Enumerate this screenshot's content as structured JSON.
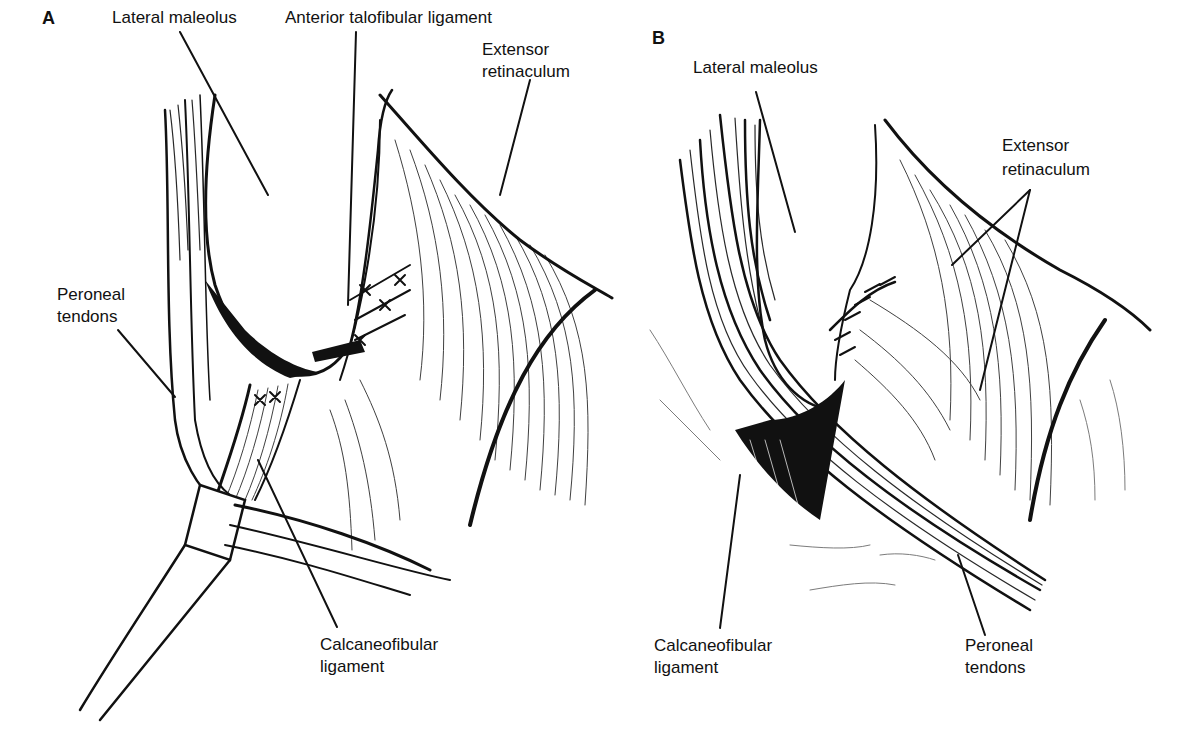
{
  "panels": [
    {
      "id": "A",
      "letter": "A",
      "labels": {
        "lateral_maleolus": "Lateral maleolus",
        "anterior_talofibular_ligament": "Anterior talofibular ligament",
        "extensor_retinaculum_1": "Extensor",
        "extensor_retinaculum_2": "retinaculum",
        "peroneal_tendons_1": "Peroneal",
        "peroneal_tendons_2": "tendons",
        "calcaneofibular_ligament_1": "Calcaneofibular",
        "calcaneofibular_ligament_2": "ligament"
      }
    },
    {
      "id": "B",
      "letter": "B",
      "labels": {
        "lateral_maleolus": "Lateral maleolus",
        "extensor_retinaculum_1": "Extensor",
        "extensor_retinaculum_2": "retinaculum",
        "calcaneofibular_ligament_1": "Calcaneofibular",
        "calcaneofibular_ligament_2": "ligament",
        "peroneal_tendons_1": "Peroneal",
        "peroneal_tendons_2": "tendons"
      }
    }
  ]
}
